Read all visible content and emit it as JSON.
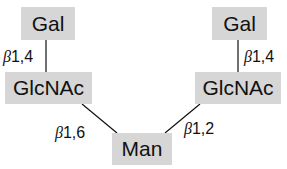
{
  "diagram": {
    "nodes": {
      "gal_left": "Gal",
      "glcnac_left": "GlcNAc",
      "man": "Man",
      "gal_right": "Gal",
      "glcnac_right": "GlcNAc"
    },
    "links": {
      "left_gal_glcnac": {
        "beta": "β",
        "label": "1,4"
      },
      "left_glcnac_man": {
        "beta": "β",
        "label": "1,6"
      },
      "right_gal_glcnac": {
        "beta": "β",
        "label": "1,4"
      },
      "right_glcnac_man": {
        "beta": "β",
        "label": "1,2"
      }
    },
    "colors": {
      "box": "#d6d6d6",
      "line": "#111111"
    }
  }
}
